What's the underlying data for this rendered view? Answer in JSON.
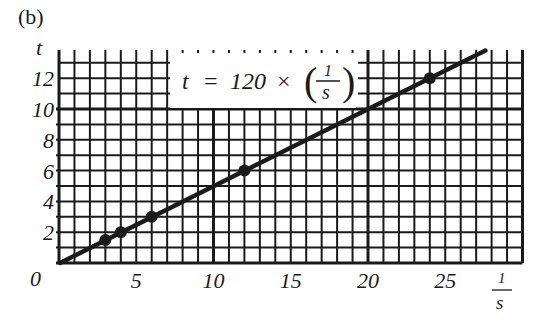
{
  "panel_label": "(b)",
  "chart_data": {
    "type": "scatter",
    "title": "",
    "panel": "(b)",
    "xlabel": "1/s",
    "ylabel": "t",
    "xlim": [
      0,
      30
    ],
    "ylim": [
      0,
      13
    ],
    "x_ticks": [
      0,
      5,
      10,
      15,
      20,
      25
    ],
    "y_ticks": [
      2,
      4,
      6,
      8,
      10,
      12
    ],
    "origin_label": "0",
    "grid": true,
    "minor_grid_step": 1,
    "annotation": "t = 120 × (1/s)",
    "series": [
      {
        "name": "measured points",
        "type": "scatter",
        "x": [
          3,
          4,
          6,
          12,
          24
        ],
        "y": [
          1.5,
          2,
          3,
          6,
          12
        ]
      },
      {
        "name": "fit line",
        "type": "line",
        "x": [
          0,
          27.6
        ],
        "y": [
          0,
          13.8
        ]
      }
    ]
  },
  "labels": {
    "panel": "(b)",
    "y_axis": "t",
    "x_axis_num": "1",
    "x_axis_den": "s",
    "origin": "0",
    "formula_lhs": "t",
    "formula_eq": "=",
    "formula_const": "120",
    "formula_times": "×",
    "formula_frac_num": "1",
    "formula_frac_den": "s"
  },
  "colors": {
    "ink": "#1a1a1a",
    "paper": "#ffffff"
  }
}
